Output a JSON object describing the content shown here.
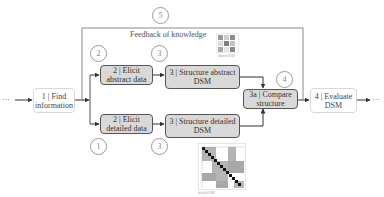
{
  "diagram": {
    "feedback_label": "Feedback of knowledge",
    "ellipsis_in": "···",
    "ellipsis_out": "···",
    "nodes": [
      {
        "id": "find",
        "line1": "1 | Find",
        "line2": "information",
        "style": "plain"
      },
      {
        "id": "elicit-abstract",
        "line1": "2 | Elicit",
        "line2": "abstract data",
        "style": "grey"
      },
      {
        "id": "structure-abstract",
        "line1": "3 | Structure abstract",
        "line2": "DSM",
        "style": "grey"
      },
      {
        "id": "elicit-detailed",
        "line1": "2 | Elicit",
        "line2": "detailed data",
        "style": "grey"
      },
      {
        "id": "structure-detailed",
        "line1": "3 | Structure detailed",
        "line2": "DSM",
        "style": "grey"
      },
      {
        "id": "compare",
        "line1": "3a | Compare",
        "line2": "structure",
        "style": "grey"
      },
      {
        "id": "evaluate",
        "line1": "4 | Evaluate",
        "line2": "DSM",
        "style": "plain"
      }
    ],
    "markers": [
      {
        "id": "m5",
        "value": "5"
      },
      {
        "id": "m2",
        "value": "2"
      },
      {
        "id": "m3-top",
        "value": "3"
      },
      {
        "id": "m4",
        "value": "4"
      },
      {
        "id": "m1",
        "value": "1"
      },
      {
        "id": "m3-bottom",
        "value": "3"
      }
    ],
    "dsm_abstract_caption": "abstract DSM",
    "dsm_detailed_caption": "detailed DSM"
  },
  "colors": {
    "box_fill": "#d9d9d9",
    "box_border": "#555555",
    "line": "#666666",
    "frame": "#8a8a8a",
    "marker": "#9a9a9a"
  }
}
